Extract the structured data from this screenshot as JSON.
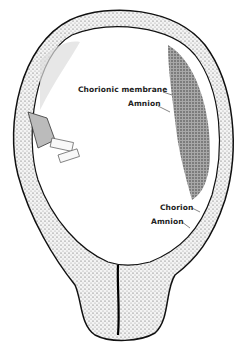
{
  "figure": {
    "labels": [
      {
        "id": "chorionic-membrane",
        "text": "Chorionic membrane",
        "x": 78,
        "y": 89
      },
      {
        "id": "amnion-upper",
        "text": "Amnion",
        "x": 128,
        "y": 103
      },
      {
        "id": "chorion",
        "text": "Chorion",
        "x": 160,
        "y": 203
      },
      {
        "id": "amnion-lower",
        "text": "Amnion",
        "x": 151,
        "y": 217
      }
    ]
  }
}
